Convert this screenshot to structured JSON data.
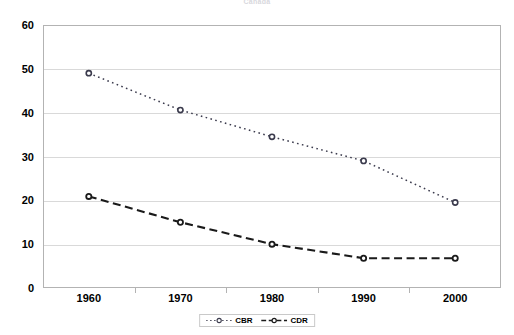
{
  "chart_data": {
    "type": "line",
    "title": "Canada",
    "xlabel": "",
    "ylabel": "",
    "x": [
      "1960",
      "1970",
      "1980",
      "1990",
      "2000"
    ],
    "categories": [
      "1960",
      "1970",
      "1980",
      "1990",
      "2000"
    ],
    "series": [
      {
        "name": "CBR",
        "values": [
          49,
          40.6,
          34.5,
          29,
          19.5
        ],
        "line_style": "dotted",
        "marker": "circle-open",
        "color": "#3b3b4d"
      },
      {
        "name": "CDR",
        "values": [
          20.9,
          15,
          10,
          6.8,
          6.8
        ],
        "line_style": "dashed",
        "marker": "circle-open",
        "color": "#1a1a1a"
      }
    ],
    "ylim": [
      0,
      60
    ],
    "yticks": [
      "0",
      "10",
      "20",
      "30",
      "40",
      "50",
      "60"
    ],
    "ytick_values": [
      0,
      10,
      20,
      30,
      40,
      50,
      60
    ],
    "grid": true,
    "legend_position": "bottom",
    "legend_entries": [
      "CBR",
      "CDR"
    ]
  },
  "legend": {
    "items": [
      {
        "label": "CBR"
      },
      {
        "label": "CDR"
      }
    ]
  }
}
